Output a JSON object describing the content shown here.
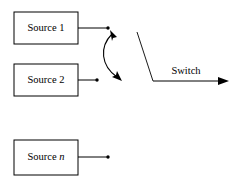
{
  "diagram": {
    "type": "block-diagram",
    "stroke_color": "#000000",
    "background_color": "#ffffff",
    "sources": [
      {
        "id": "source-1",
        "label": "Source 1",
        "label_prefix": "Source ",
        "index_text": "1",
        "index_italic": false,
        "box": {
          "x": 14,
          "y": 12,
          "width": 64,
          "height": 32
        },
        "wire": {
          "x1": 78,
          "y1": 28,
          "x2": 108,
          "y2": 28
        },
        "terminal_dot": {
          "cx": 108,
          "cy": 28,
          "r": 1.7
        }
      },
      {
        "id": "source-2",
        "label": "Source 2",
        "label_prefix": "Source ",
        "index_text": "2",
        "index_italic": false,
        "box": {
          "x": 14,
          "y": 64,
          "width": 64,
          "height": 32
        },
        "wire": {
          "x1": 78,
          "y1": 80,
          "x2": 97,
          "y2": 80
        },
        "terminal_dot": {
          "cx": 97,
          "cy": 80,
          "r": 1.7
        }
      },
      {
        "id": "source-n",
        "label": "Source n",
        "label_prefix": "Source ",
        "index_text": "n",
        "index_italic": true,
        "box": {
          "x": 14,
          "y": 140,
          "width": 64,
          "height": 35
        },
        "wire": {
          "x1": 78,
          "y1": 157,
          "x2": 108,
          "y2": 157
        },
        "terminal_dot": {
          "cx": 108,
          "cy": 157,
          "r": 1.7
        }
      }
    ],
    "selector_arc": {
      "id": "selector-double-arrow",
      "path": "M 111 32 C 98 46 100 66 118 78",
      "head_top": {
        "x": 111,
        "y": 32,
        "angle_deg": -135
      },
      "head_bottom": {
        "x": 119,
        "y": 79,
        "angle_deg": 40
      },
      "double_headed": true
    },
    "switch": {
      "id": "switch-lever",
      "label": "Switch",
      "label_pos": {
        "x": 186,
        "y": 74
      },
      "lever_path": "M 137 32 L 153 81",
      "output_line": {
        "x1": 153,
        "y1": 81,
        "x2": 221,
        "y2": 81
      },
      "output_arrowhead": {
        "x": 229,
        "y": 81,
        "angle_deg": 0
      },
      "pivot": {
        "x": 153,
        "y": 81
      }
    }
  }
}
